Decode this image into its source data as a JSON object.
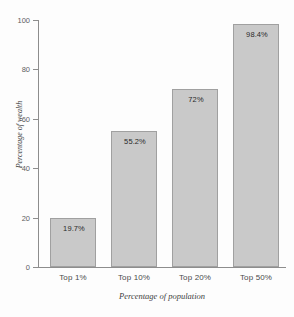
{
  "chart_data": {
    "type": "bar",
    "title": "",
    "subtitle": "",
    "categories": [
      "Top 1%",
      "Top 10%",
      "Top 20%",
      "Top 50%"
    ],
    "values": [
      19.7,
      55.2,
      72,
      98.4
    ],
    "value_labels": [
      "19.7%",
      "55.2%",
      "72%",
      "98.4%"
    ],
    "xlabel": "Percentage of population",
    "ylabel": "Percentage of wealth",
    "ylim": [
      0,
      100
    ],
    "yticks": [
      0,
      20,
      40,
      60,
      80,
      100
    ],
    "ytick_labels": [
      "0",
      "20",
      "40",
      "60",
      "80",
      "100"
    ],
    "grid": false,
    "legend": false,
    "legend_position": "none",
    "bar_fill_color": "#c9c9c9",
    "bar_border_color": "#a0a0a0",
    "axis_color": "#8d8d8d",
    "background_color": "#fdfdfd",
    "text_color": "#3d3d3d"
  }
}
